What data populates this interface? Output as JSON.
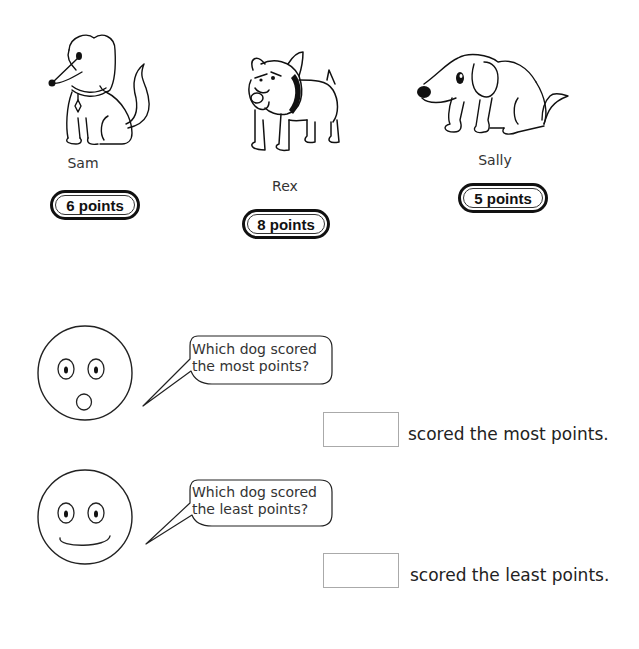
{
  "dogs": [
    {
      "name": "Sam",
      "points": 6,
      "points_label": "6 points",
      "icon": "dog-sam-icon"
    },
    {
      "name": "Rex",
      "points": 8,
      "points_label": "8 points",
      "icon": "dog-rex-icon"
    },
    {
      "name": "Sally",
      "points": 5,
      "points_label": "5 points",
      "icon": "dog-sally-icon"
    }
  ],
  "questions": [
    {
      "face": "surprised-face-icon",
      "bubble_line1": "Which dog scored",
      "bubble_line2": "the most points?",
      "answer_value": "",
      "answer_suffix": "scored the most points."
    },
    {
      "face": "smiling-face-icon",
      "bubble_line1": "Which dog scored",
      "bubble_line2": "the least points?",
      "answer_value": "",
      "answer_suffix": "scored the least points."
    }
  ]
}
